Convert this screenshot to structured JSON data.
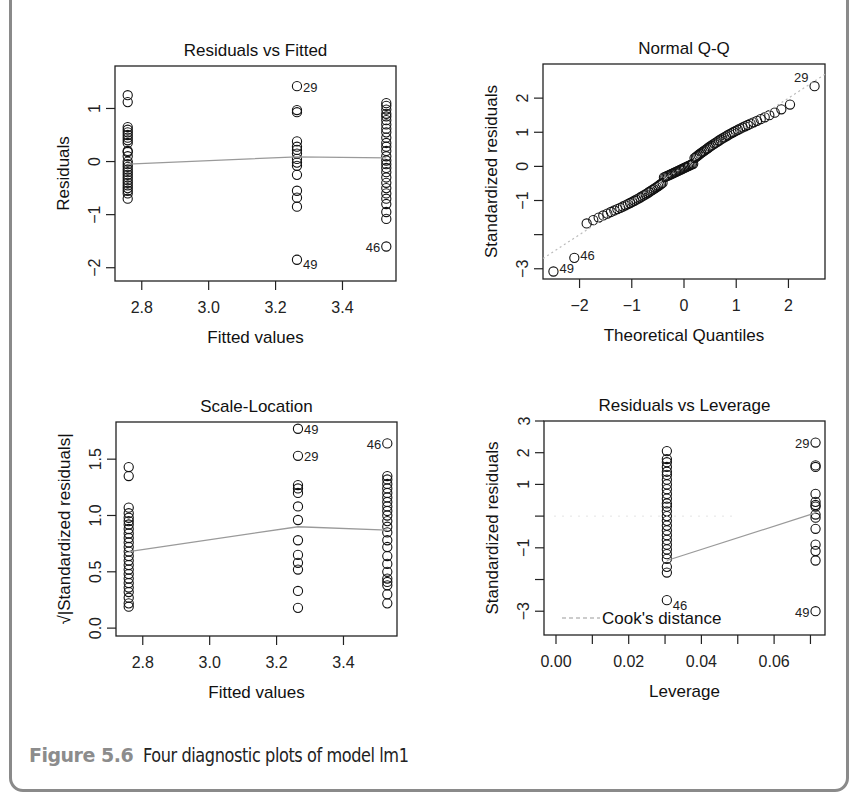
{
  "caption": {
    "label": "Figure 5.6",
    "text": "Four diagnostic plots of model lm1"
  },
  "colors": {
    "frame_border": "#8a8a8a",
    "caption_label": "#8c8c8c",
    "points": "#111111",
    "smooth_line": "#9a9a9a",
    "reference_line": "#bbbbbb"
  },
  "chart_data": [
    {
      "id": "resid_fitted",
      "type": "scatter",
      "title": "Residuals vs Fitted",
      "xlabel": "Fitted values",
      "ylabel": "Residuals",
      "xticks": [
        2.8,
        3.0,
        3.2,
        3.4
      ],
      "xtick_labels": [
        "2.8",
        "3.0",
        "3.2",
        "3.4"
      ],
      "yticks": [
        -2,
        -1,
        0,
        1
      ],
      "ytick_labels": [
        "-2",
        "-1",
        "0",
        "1"
      ],
      "xlim": [
        2.72,
        3.56
      ],
      "ylim": [
        -2.25,
        1.8
      ],
      "frame": {
        "left": 115,
        "top": 66,
        "right": 396,
        "bottom": 281
      },
      "grid": false,
      "x_groups": [
        2.758,
        3.264,
        3.531
      ],
      "points": [
        [
          2.758,
          1.25
        ],
        [
          2.758,
          1.12
        ],
        [
          2.758,
          0.65
        ],
        [
          2.758,
          0.6
        ],
        [
          2.758,
          0.55
        ],
        [
          2.758,
          0.5
        ],
        [
          2.758,
          0.45
        ],
        [
          2.758,
          0.4
        ],
        [
          2.758,
          0.35
        ],
        [
          2.758,
          0.2
        ],
        [
          2.758,
          0.18
        ],
        [
          2.758,
          0.1
        ],
        [
          2.758,
          0.0
        ],
        [
          2.758,
          -0.05
        ],
        [
          2.758,
          -0.1
        ],
        [
          2.758,
          -0.15
        ],
        [
          2.758,
          -0.2
        ],
        [
          2.758,
          -0.25
        ],
        [
          2.758,
          -0.3
        ],
        [
          2.758,
          -0.35
        ],
        [
          2.758,
          -0.4
        ],
        [
          2.758,
          -0.45
        ],
        [
          2.758,
          -0.5
        ],
        [
          2.758,
          -0.55
        ],
        [
          2.758,
          -0.6
        ],
        [
          2.758,
          -0.7
        ],
        [
          3.264,
          1.42
        ],
        [
          3.264,
          0.97
        ],
        [
          3.264,
          0.93
        ],
        [
          3.264,
          0.38
        ],
        [
          3.264,
          0.28
        ],
        [
          3.264,
          0.22
        ],
        [
          3.264,
          0.15
        ],
        [
          3.264,
          0.05
        ],
        [
          3.264,
          -0.02
        ],
        [
          3.264,
          -0.08
        ],
        [
          3.264,
          -0.25
        ],
        [
          3.264,
          -0.55
        ],
        [
          3.264,
          -0.68
        ],
        [
          3.264,
          -0.85
        ],
        [
          3.264,
          -1.85
        ],
        [
          3.531,
          1.1
        ],
        [
          3.531,
          1.05
        ],
        [
          3.531,
          0.98
        ],
        [
          3.531,
          0.9
        ],
        [
          3.531,
          0.85
        ],
        [
          3.531,
          0.78
        ],
        [
          3.531,
          0.7
        ],
        [
          3.531,
          0.62
        ],
        [
          3.531,
          0.55
        ],
        [
          3.531,
          0.45
        ],
        [
          3.531,
          0.35
        ],
        [
          3.531,
          0.28
        ],
        [
          3.531,
          0.2
        ],
        [
          3.531,
          0.1
        ],
        [
          3.531,
          0.02
        ],
        [
          3.531,
          -0.05
        ],
        [
          3.531,
          -0.12
        ],
        [
          3.531,
          -0.2
        ],
        [
          3.531,
          -0.3
        ],
        [
          3.531,
          -0.4
        ],
        [
          3.531,
          -0.5
        ],
        [
          3.531,
          -0.6
        ],
        [
          3.531,
          -0.7
        ],
        [
          3.531,
          -0.8
        ],
        [
          3.531,
          -0.95
        ],
        [
          3.531,
          -1.08
        ],
        [
          3.531,
          -1.6
        ]
      ],
      "smooth": [
        [
          2.758,
          -0.05
        ],
        [
          3.264,
          0.09
        ],
        [
          3.531,
          0.07
        ]
      ],
      "labels": [
        {
          "text": "29",
          "x": 3.264,
          "y": 1.42,
          "side": "right"
        },
        {
          "text": "49",
          "x": 3.264,
          "y": -1.85,
          "side": "right",
          "dy": 4
        },
        {
          "text": "46",
          "x": 3.531,
          "y": -1.6,
          "side": "left"
        }
      ]
    },
    {
      "id": "normal_qq",
      "type": "scatter",
      "title": "Normal Q-Q",
      "xlabel": "Theoretical Quantiles",
      "ylabel": "Standardized residuals",
      "xticks": [
        -2,
        -1,
        0,
        1,
        2
      ],
      "xtick_labels": [
        "-2",
        "-1",
        "0",
        "1",
        "2"
      ],
      "yticks": [
        -3,
        -2,
        -1,
        0,
        1,
        2
      ],
      "ytick_labels": [
        "-3",
        "",
        "-1",
        "0",
        "1",
        "2"
      ],
      "xlim": [
        -2.7,
        2.7
      ],
      "ylim": [
        -3.3,
        3.0
      ],
      "frame": {
        "left": 543,
        "top": 64,
        "right": 825,
        "bottom": 279
      },
      "grid": false,
      "qq_n": 100,
      "reference_line": {
        "slope": 1.0,
        "intercept": 0.0,
        "dashed": true
      },
      "extremes": [
        {
          "q": -2.5,
          "r": -3.08,
          "label": "49"
        },
        {
          "q": -2.1,
          "r": -2.68,
          "label": "46"
        },
        {
          "q": 2.5,
          "r": 2.35,
          "label": "29"
        }
      ]
    },
    {
      "id": "scale_location",
      "type": "scatter",
      "title": "Scale-Location",
      "xlabel": "Fitted values",
      "ylabel": "√|Standardized residuals|",
      "xticks": [
        2.8,
        3.0,
        3.2,
        3.4
      ],
      "xtick_labels": [
        "2.8",
        "3.0",
        "3.2",
        "3.4"
      ],
      "yticks": [
        0.0,
        0.5,
        1.0,
        1.5
      ],
      "ytick_labels": [
        "0.0",
        "0.5",
        "1.0",
        "1.5"
      ],
      "xlim": [
        2.72,
        3.56
      ],
      "ylim": [
        -0.07,
        1.83
      ],
      "frame": {
        "left": 116,
        "top": 422,
        "right": 397,
        "bottom": 636
      },
      "grid": false,
      "points": [
        [
          2.758,
          1.43
        ],
        [
          2.758,
          1.35
        ],
        [
          2.758,
          1.07
        ],
        [
          2.758,
          1.02
        ],
        [
          2.758,
          0.98
        ],
        [
          2.758,
          0.95
        ],
        [
          2.758,
          0.92
        ],
        [
          2.758,
          0.88
        ],
        [
          2.758,
          0.84
        ],
        [
          2.758,
          0.8
        ],
        [
          2.758,
          0.76
        ],
        [
          2.758,
          0.72
        ],
        [
          2.758,
          0.68
        ],
        [
          2.758,
          0.64
        ],
        [
          2.758,
          0.6
        ],
        [
          2.758,
          0.56
        ],
        [
          2.758,
          0.52
        ],
        [
          2.758,
          0.48
        ],
        [
          2.758,
          0.44
        ],
        [
          2.758,
          0.4
        ],
        [
          2.758,
          0.36
        ],
        [
          2.758,
          0.32
        ],
        [
          2.758,
          0.27
        ],
        [
          2.758,
          0.22
        ],
        [
          2.758,
          0.19
        ],
        [
          3.264,
          1.77
        ],
        [
          3.264,
          1.53
        ],
        [
          3.264,
          1.27
        ],
        [
          3.264,
          1.24
        ],
        [
          3.264,
          1.2
        ],
        [
          3.264,
          1.08
        ],
        [
          3.264,
          0.96
        ],
        [
          3.264,
          0.78
        ],
        [
          3.264,
          0.65
        ],
        [
          3.264,
          0.58
        ],
        [
          3.264,
          0.52
        ],
        [
          3.264,
          0.33
        ],
        [
          3.264,
          0.18
        ],
        [
          3.531,
          1.64
        ],
        [
          3.531,
          1.35
        ],
        [
          3.531,
          1.32
        ],
        [
          3.531,
          1.28
        ],
        [
          3.531,
          1.24
        ],
        [
          3.531,
          1.2
        ],
        [
          3.531,
          1.16
        ],
        [
          3.531,
          1.12
        ],
        [
          3.531,
          1.08
        ],
        [
          3.531,
          1.04
        ],
        [
          3.531,
          1.0
        ],
        [
          3.531,
          0.95
        ],
        [
          3.531,
          0.9
        ],
        [
          3.531,
          0.85
        ],
        [
          3.531,
          0.78
        ],
        [
          3.531,
          0.72
        ],
        [
          3.531,
          0.64
        ],
        [
          3.531,
          0.57
        ],
        [
          3.531,
          0.5
        ],
        [
          3.531,
          0.44
        ],
        [
          3.531,
          0.41
        ],
        [
          3.531,
          0.38
        ],
        [
          3.531,
          0.3
        ],
        [
          3.531,
          0.22
        ]
      ],
      "smooth": [
        [
          2.758,
          0.68
        ],
        [
          3.264,
          0.9
        ],
        [
          3.531,
          0.87
        ]
      ],
      "labels": [
        {
          "text": "49",
          "x": 3.264,
          "y": 1.77,
          "side": "right"
        },
        {
          "text": "29",
          "x": 3.264,
          "y": 1.53,
          "side": "right"
        },
        {
          "text": "46",
          "x": 3.531,
          "y": 1.64,
          "side": "left"
        }
      ]
    },
    {
      "id": "resid_leverage",
      "type": "scatter",
      "title": "Residuals vs Leverage",
      "xlabel": "Leverage",
      "ylabel": "Standardized residuals",
      "xticks": [
        0.0,
        0.01,
        0.02,
        0.03,
        0.04,
        0.05,
        0.06,
        0.07
      ],
      "xtick_labels": [
        "0.00",
        "",
        "0.02",
        "",
        "0.04",
        "",
        "0.06",
        ""
      ],
      "yticks": [
        -3,
        -2,
        -1,
        0,
        1,
        2,
        3
      ],
      "ytick_labels": [
        "-3",
        "",
        "-1",
        "",
        "1",
        "2",
        "3"
      ],
      "xlim": [
        -0.0033,
        0.074
      ],
      "ylim": [
        -3.75,
        3.0
      ],
      "frame": {
        "left": 544,
        "top": 421,
        "right": 825,
        "bottom": 635
      },
      "grid": false,
      "points_x_groups": [
        0.0305,
        0.0714
      ],
      "points": [
        [
          0.0305,
          2.05
        ],
        [
          0.0305,
          1.8
        ],
        [
          0.0305,
          1.7
        ],
        [
          0.0305,
          1.55
        ],
        [
          0.0305,
          1.4
        ],
        [
          0.0305,
          1.3
        ],
        [
          0.0305,
          1.15
        ],
        [
          0.0305,
          1.0
        ],
        [
          0.0305,
          0.85
        ],
        [
          0.0305,
          0.7
        ],
        [
          0.0305,
          0.55
        ],
        [
          0.0305,
          0.4
        ],
        [
          0.0305,
          0.3
        ],
        [
          0.0305,
          0.15
        ],
        [
          0.0305,
          0.0
        ],
        [
          0.0305,
          -0.15
        ],
        [
          0.0305,
          -0.3
        ],
        [
          0.0305,
          -0.45
        ],
        [
          0.0305,
          -0.6
        ],
        [
          0.0305,
          -0.75
        ],
        [
          0.0305,
          -0.9
        ],
        [
          0.0305,
          -1.05
        ],
        [
          0.0305,
          -1.2
        ],
        [
          0.0305,
          -1.35
        ],
        [
          0.0305,
          -1.6
        ],
        [
          0.0305,
          -1.78
        ],
        [
          0.0305,
          -2.65
        ],
        [
          0.0714,
          2.32
        ],
        [
          0.0714,
          1.6
        ],
        [
          0.0714,
          1.55
        ],
        [
          0.0714,
          0.7
        ],
        [
          0.0714,
          0.45
        ],
        [
          0.0714,
          0.35
        ],
        [
          0.0714,
          0.3
        ],
        [
          0.0714,
          0.05
        ],
        [
          0.0714,
          -0.05
        ],
        [
          0.0714,
          -0.4
        ],
        [
          0.0714,
          -0.9
        ],
        [
          0.0714,
          -1.1
        ],
        [
          0.0714,
          -1.4
        ],
        [
          0.0714,
          -3.0
        ]
      ],
      "smooth": [
        [
          0.0305,
          -1.4
        ],
        [
          0.0714,
          0.1
        ]
      ],
      "labels": [
        {
          "text": "29",
          "x": 0.0714,
          "y": 2.32,
          "side": "left"
        },
        {
          "text": "46",
          "x": 0.0305,
          "y": -2.65,
          "side": "right",
          "dy": 4
        },
        {
          "text": "49",
          "x": 0.0714,
          "y": -3.0,
          "side": "left"
        }
      ],
      "legend": {
        "text": "Cook's distance",
        "position": "bottomleft",
        "line": "dashed"
      }
    }
  ]
}
